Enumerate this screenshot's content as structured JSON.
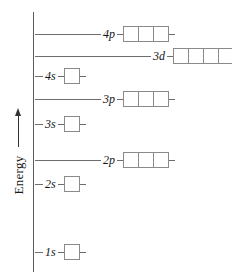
{
  "diagram": {
    "axis": {
      "label": "Energy",
      "arrow_direction": "up",
      "arrow_icon": "arrow-up-icon"
    }
  },
  "chart_data": {
    "type": "diagram",
    "ylabel": "Energy",
    "xlabel": "",
    "grid": false,
    "legend": false,
    "note": "Relative orbital energies; higher position = higher energy. Each box is one orbital holding up to 2 electrons.",
    "categories": [
      "1s",
      "2s",
      "2p",
      "3s",
      "3p",
      "4s",
      "3d",
      "4p"
    ],
    "levels": [
      {
        "label": "1s",
        "subshell": "s",
        "orbital_count": 1,
        "energy_rank": 1,
        "top_px": 243,
        "leader_width_px": 8,
        "label_left_px": 35
      },
      {
        "label": "2s",
        "subshell": "s",
        "orbital_count": 1,
        "energy_rank": 2,
        "top_px": 175,
        "leader_width_px": 8,
        "label_left_px": 35
      },
      {
        "label": "2p",
        "subshell": "p",
        "orbital_count": 3,
        "energy_rank": 3,
        "top_px": 151,
        "leader_width_px": 66,
        "label_left_px": 35
      },
      {
        "label": "3s",
        "subshell": "s",
        "orbital_count": 1,
        "energy_rank": 4,
        "top_px": 115,
        "leader_width_px": 8,
        "label_left_px": 35
      },
      {
        "label": "3p",
        "subshell": "p",
        "orbital_count": 3,
        "energy_rank": 5,
        "top_px": 90,
        "leader_width_px": 66,
        "label_left_px": 35
      },
      {
        "label": "4s",
        "subshell": "s",
        "orbital_count": 1,
        "energy_rank": 6,
        "top_px": 67,
        "leader_width_px": 8,
        "label_left_px": 35
      },
      {
        "label": "3d",
        "subshell": "d",
        "orbital_count": 5,
        "energy_rank": 7,
        "top_px": 47,
        "leader_width_px": 116,
        "label_left_px": 35
      },
      {
        "label": "4p",
        "subshell": "p",
        "orbital_count": 3,
        "energy_rank": 8,
        "top_px": 25,
        "leader_width_px": 66,
        "label_left_px": 35
      }
    ]
  },
  "colors": {
    "background": "#ffffff",
    "axis": "#5a5a5a",
    "leader_line": "#6e6e6e",
    "box_border": "#8a8a8a",
    "text": "#141414",
    "arrow": "#333333"
  }
}
